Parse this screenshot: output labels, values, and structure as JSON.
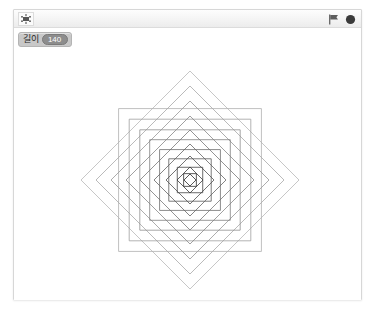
{
  "window": {
    "frame_color": "#d7d7d7",
    "background": "#ffffff"
  },
  "toolbar": {
    "sprite_icon_name": "sprite-thumbnail-icon",
    "green_flag_label": "Start",
    "stop_button_label": "Stop",
    "green_flag_color": "#4b9b3f",
    "stop_button_color": "#3a3a3a"
  },
  "watcher": {
    "name": "길이",
    "value": "140",
    "background": "#c8c8c8",
    "value_background": "#8d8d8d"
  },
  "stage": {
    "background": "#ffffff",
    "drawing_name": "nested-rotated-squares-spiral"
  },
  "chart_data": {
    "type": "line",
    "title": "",
    "xlabel": "",
    "ylabel": "",
    "grid": false,
    "legend": null,
    "center": [
      190,
      180
    ],
    "xlim": [
      13,
      362
    ],
    "ylim": [
      27,
      299
    ],
    "rotation_step_deg": 45,
    "squares": [
      {
        "index": 1,
        "half_diagonal": 109,
        "angle_deg": 45,
        "stroke": "#b9b9b9",
        "width": 0.8
      },
      {
        "index": 2,
        "half_diagonal": 101,
        "angle_deg": 0,
        "stroke": "#b0b0b0",
        "width": 0.8
      },
      {
        "index": 3,
        "half_diagonal": 94,
        "angle_deg": 45,
        "stroke": "#a8a8a8",
        "width": 0.8
      },
      {
        "index": 4,
        "half_diagonal": 86,
        "angle_deg": 0,
        "stroke": "#a0a0a0",
        "width": 0.8
      },
      {
        "index": 5,
        "half_diagonal": 79,
        "angle_deg": 45,
        "stroke": "#989898",
        "width": 0.8
      },
      {
        "index": 6,
        "half_diagonal": 71,
        "angle_deg": 0,
        "stroke": "#909090",
        "width": 0.8
      },
      {
        "index": 7,
        "half_diagonal": 64,
        "angle_deg": 45,
        "stroke": "#888888",
        "width": 0.8
      },
      {
        "index": 8,
        "half_diagonal": 57,
        "angle_deg": 0,
        "stroke": "#808080",
        "width": 0.8
      },
      {
        "index": 9,
        "half_diagonal": 50,
        "angle_deg": 45,
        "stroke": "#787878",
        "width": 0.8
      },
      {
        "index": 10,
        "half_diagonal": 43,
        "angle_deg": 0,
        "stroke": "#6e6e6e",
        "width": 0.8
      },
      {
        "index": 11,
        "half_diagonal": 36,
        "angle_deg": 45,
        "stroke": "#646464",
        "width": 0.8
      },
      {
        "index": 12,
        "half_diagonal": 30,
        "angle_deg": 0,
        "stroke": "#5a5a5a",
        "width": 0.8
      },
      {
        "index": 13,
        "half_diagonal": 24,
        "angle_deg": 45,
        "stroke": "#505050",
        "width": 0.8
      },
      {
        "index": 14,
        "half_diagonal": 18,
        "angle_deg": 0,
        "stroke": "#464646",
        "width": 0.8
      },
      {
        "index": 15,
        "half_diagonal": 13,
        "angle_deg": 45,
        "stroke": "#3c3c3c",
        "width": 0.8
      },
      {
        "index": 16,
        "half_diagonal": 9,
        "angle_deg": 0,
        "stroke": "#343434",
        "width": 0.8
      },
      {
        "index": 17,
        "half_diagonal": 6,
        "angle_deg": 45,
        "stroke": "#2c2c2c",
        "width": 0.8
      }
    ]
  }
}
